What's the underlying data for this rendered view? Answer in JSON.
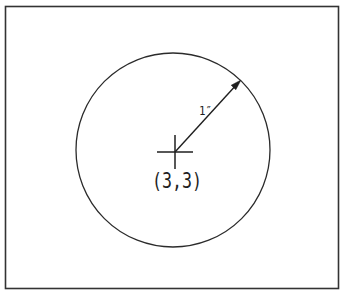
{
  "figure": {
    "center_label": "(3,3)",
    "radius_label": "1″",
    "stroke_color": "#2b2b2b",
    "border_color": "#333333",
    "background_color": "#ffffff"
  }
}
